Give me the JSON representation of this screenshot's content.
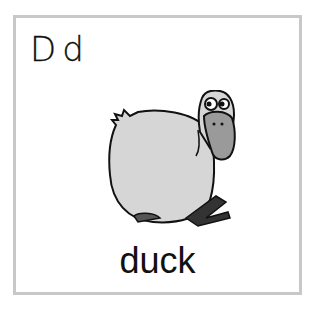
{
  "card": {
    "letters": "Dd",
    "word": "duck",
    "illustration": "duck-illustration"
  },
  "colors": {
    "border": "#c8c8c8",
    "body": "#d4d4d4",
    "beak": "#9a9a9a",
    "outline": "#111111"
  }
}
